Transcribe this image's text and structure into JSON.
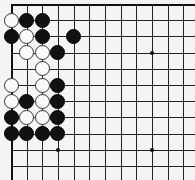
{
  "board": {
    "origin": [
      11,
      4
    ],
    "spacing_x": 15.65,
    "spacing_y": 16.2,
    "cols": 12,
    "rows": 11,
    "line_color": "#222222",
    "star_points": [
      [
        9,
        3
      ],
      [
        3,
        9
      ],
      [
        9,
        9
      ]
    ],
    "stones": [
      {
        "c": 0,
        "r": 1,
        "color": "white"
      },
      {
        "c": 1,
        "r": 1,
        "color": "black"
      },
      {
        "c": 2,
        "r": 1,
        "color": "black"
      },
      {
        "c": 0,
        "r": 2,
        "color": "black"
      },
      {
        "c": 1,
        "r": 2,
        "color": "white"
      },
      {
        "c": 2,
        "r": 2,
        "color": "black"
      },
      {
        "c": 4,
        "r": 2,
        "color": "black"
      },
      {
        "c": 1,
        "r": 3,
        "color": "white"
      },
      {
        "c": 2,
        "r": 3,
        "color": "white"
      },
      {
        "c": 3,
        "r": 3,
        "color": "black"
      },
      {
        "c": 2,
        "r": 4,
        "color": "white"
      },
      {
        "c": 0,
        "r": 5,
        "color": "white"
      },
      {
        "c": 2,
        "r": 5,
        "color": "white"
      },
      {
        "c": 3,
        "r": 5,
        "color": "black"
      },
      {
        "c": 0,
        "r": 6,
        "color": "white"
      },
      {
        "c": 1,
        "r": 6,
        "color": "black"
      },
      {
        "c": 2,
        "r": 6,
        "color": "white"
      },
      {
        "c": 3,
        "r": 6,
        "color": "black"
      },
      {
        "c": 0,
        "r": 7,
        "color": "black"
      },
      {
        "c": 1,
        "r": 7,
        "color": "white"
      },
      {
        "c": 2,
        "r": 7,
        "color": "white"
      },
      {
        "c": 3,
        "r": 7,
        "color": "black"
      },
      {
        "c": 0,
        "r": 8,
        "color": "black"
      },
      {
        "c": 1,
        "r": 8,
        "color": "black"
      },
      {
        "c": 2,
        "r": 8,
        "color": "black"
      },
      {
        "c": 3,
        "r": 8,
        "color": "black"
      }
    ]
  }
}
